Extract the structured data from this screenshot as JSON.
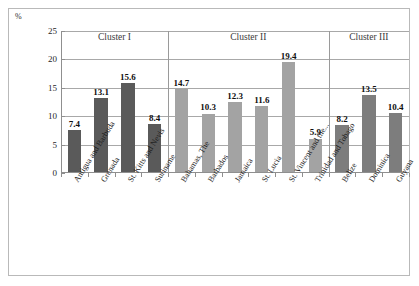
{
  "unit_label": "%",
  "chart_data": {
    "type": "bar",
    "title": "",
    "subtitle": "",
    "xlabel": "",
    "ylabel": "%",
    "ylim": [
      0,
      25
    ],
    "yticks": [
      0,
      5,
      10,
      15,
      20,
      25
    ],
    "grid": true,
    "legend": "none",
    "categories": [
      "Antigua and Barbuda",
      "Grenada",
      "St. Kitts and Nevis",
      "Suriname",
      "Bahamas, The",
      "Barbados",
      "Jamaica",
      "St. Lucia",
      "St. Vincent and the...",
      "Trinidad and Tobago",
      "Belize",
      "Dominica",
      "Guyana"
    ],
    "values": [
      7.4,
      13.1,
      15.6,
      8.4,
      14.7,
      10.3,
      12.3,
      11.6,
      19.4,
      5.9,
      8.2,
      13.5,
      10.4
    ],
    "data_labels": [
      "7.4",
      "13.1",
      "15.6",
      "8.4",
      "14.7",
      "10.3",
      "12.3",
      "11.6",
      "19.4",
      "5.9",
      "8.2",
      "13.5",
      "10.4"
    ],
    "groups": [
      {
        "label": "Cluster I",
        "start_index": 0,
        "end_index": 3,
        "color": "#5a5a5a"
      },
      {
        "label": "Cluster II",
        "start_index": 4,
        "end_index": 9,
        "color": "#a3a3a3"
      },
      {
        "label": "Cluster III",
        "start_index": 10,
        "end_index": 12,
        "color": "#7d7d7d"
      }
    ],
    "colors": {
      "cluster_1": "#5a5a5a",
      "cluster_2": "#a3a3a3",
      "cluster_3": "#7d7d7d",
      "gridline": "#a8a8a8",
      "axis": "#8f8f8f",
      "frame": "#b9b9b9",
      "label_text": "#101010"
    }
  }
}
